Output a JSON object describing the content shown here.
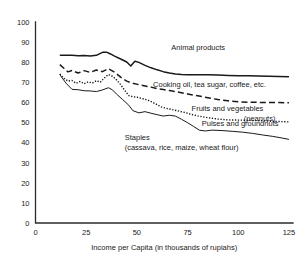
{
  "chart_data": {
    "type": "line",
    "title": "",
    "subtitle": "",
    "xlabel": "Income per Capita (in thousands of rupiahs)",
    "ylabel": "",
    "xlim": [
      0,
      127
    ],
    "ylim": [
      0,
      100
    ],
    "xticks": [
      0,
      25,
      50,
      75,
      100,
      125
    ],
    "yticks": [
      0,
      10,
      20,
      30,
      40,
      50,
      60,
      70,
      80,
      90,
      100
    ],
    "xtick_labels": [
      "0",
      "25",
      "50",
      "75",
      "100",
      "125"
    ],
    "ytick_labels": [
      "0",
      "10",
      "20",
      "30",
      "40",
      "50",
      "60",
      "70",
      "80",
      "90",
      "100"
    ],
    "grid": false,
    "legend_position": "inline-annotations",
    "series": [
      {
        "name": "Animal products",
        "style": "solid",
        "stroke_width": 1.5,
        "label_x": 67,
        "label_y": 86,
        "x": [
          12,
          15,
          18,
          21,
          24,
          27,
          30,
          33,
          35,
          37,
          39,
          42,
          45,
          47,
          49,
          51,
          54,
          57,
          60,
          63,
          66,
          69,
          72,
          75,
          80,
          85,
          90,
          95,
          100,
          105,
          110,
          115,
          120,
          125
        ],
        "y": [
          83.4,
          83.5,
          83.4,
          83.2,
          83.3,
          83.1,
          83.4,
          84.9,
          85.0,
          84.1,
          83.0,
          81.6,
          80.1,
          78.1,
          80.5,
          79.9,
          78.4,
          77.2,
          76.2,
          75.3,
          74.6,
          74.1,
          73.9,
          73.8,
          73.8,
          73.8,
          73.6,
          73.4,
          73.3,
          73.2,
          73.1,
          73.0,
          72.9,
          72.8
        ]
      },
      {
        "name": "Cooking oil, tea sugar, coffee, etc.",
        "style": "dashed",
        "stroke_width": 1.5,
        "label_x": 58,
        "label_y": 67.5,
        "x": [
          12,
          14,
          16,
          18,
          21,
          24,
          27,
          30,
          33,
          36,
          39,
          42,
          45,
          48,
          51,
          54,
          57,
          60,
          63,
          66,
          70,
          75,
          80,
          85,
          90,
          95,
          100,
          105,
          110,
          115,
          120,
          125
        ],
        "y": [
          78.8,
          77.0,
          75.2,
          75.9,
          74.6,
          75.8,
          74.9,
          76.1,
          75.3,
          76.8,
          75.0,
          72.6,
          70.6,
          69.5,
          68.8,
          68.2,
          67.6,
          66.9,
          66.4,
          65.9,
          65.2,
          64.2,
          63.3,
          62.3,
          61.4,
          60.8,
          60.3,
          60.1,
          60.0,
          59.9,
          59.9,
          59.8
        ]
      },
      {
        "name": "Fruits and vegetables",
        "style": "dotted",
        "stroke_width": 1.4,
        "label_x": 77,
        "label_y": 55.5,
        "x": [
          12,
          14,
          16,
          18,
          20,
          22,
          24,
          26,
          28,
          30,
          32,
          34,
          36,
          38,
          40,
          42,
          44,
          46,
          48,
          50,
          53,
          56,
          59,
          62,
          65,
          68,
          71,
          74,
          77,
          80,
          85,
          90,
          95,
          100,
          105,
          110,
          115,
          120,
          125
        ],
        "y": [
          74.1,
          72.0,
          70.6,
          70.9,
          69.5,
          70.4,
          69.3,
          70.2,
          69.6,
          70.8,
          70.1,
          72.2,
          73.9,
          73.0,
          71.2,
          68.8,
          66.0,
          63.4,
          62.8,
          62.6,
          61.8,
          60.9,
          59.4,
          57.8,
          56.9,
          56.3,
          55.6,
          54.9,
          54.0,
          53.3,
          52.4,
          51.7,
          51.3,
          51.2,
          51.1,
          50.9,
          50.7,
          50.5,
          50.3
        ]
      },
      {
        "name": "Pulses and groundnuts (peanuts)",
        "style": "solid-thin",
        "stroke_width": 1.0,
        "label_x": 82,
        "label_y": 48.5,
        "label2": "(peanuts)",
        "x": [
          12,
          15,
          18,
          21,
          24,
          27,
          30,
          33,
          36,
          38,
          40,
          43,
          46,
          48,
          51,
          54,
          57,
          60,
          63,
          66,
          69,
          72,
          75,
          78,
          81,
          84,
          87,
          92,
          97,
          102,
          107,
          112,
          117,
          122,
          125
        ],
        "y": [
          73.8,
          69.6,
          66.5,
          66.3,
          65.8,
          65.7,
          65.4,
          66.2,
          67.3,
          66.2,
          64.1,
          61.4,
          58.6,
          55.9,
          54.8,
          55.4,
          54.6,
          53.9,
          53.2,
          53.6,
          53.2,
          51.6,
          49.9,
          48.0,
          46.1,
          45.8,
          46.2,
          46.0,
          45.6,
          45.2,
          44.6,
          43.8,
          43.1,
          42.2,
          41.6
        ]
      }
    ],
    "annotations": [
      {
        "text": "Staples",
        "x": 44,
        "y": 41.5
      },
      {
        "text": "(cassava, rice, maize, wheat flour)",
        "x": 44,
        "y": 36.5
      }
    ]
  },
  "labels": {
    "animal_products": "Animal products",
    "cooking_oil": "Cooking oil, tea sugar, coffee, etc.",
    "fruits_vegetables": "Fruits and vegetables",
    "pulses_groundnuts": "Pulses and groundnuts",
    "pulses_groundnuts_2": "(peanuts)",
    "staples": "Staples",
    "staples_detail": "(cassava, rice, maize, wheat flour)",
    "xaxis_title": "Income per Capita (in thousands of rupiahs)"
  },
  "colors": {
    "line": "#1a1a1a",
    "axis": "#2b2b2b",
    "background": "#ffffff",
    "text": "#1a1a1a"
  }
}
